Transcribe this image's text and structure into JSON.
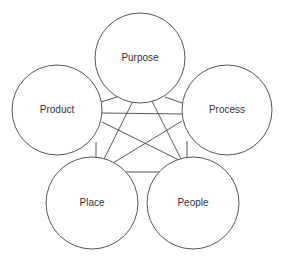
{
  "diagram": {
    "type": "five-node interconnection diagram",
    "stroke_color": "#555555",
    "text_color": "#333333",
    "background": "#ffffff",
    "nodes": [
      {
        "id": "purpose",
        "label": "Purpose",
        "cx": 140,
        "cy": 58,
        "r": 45
      },
      {
        "id": "product",
        "label": "Product",
        "cx": 57,
        "cy": 110,
        "r": 45
      },
      {
        "id": "process",
        "label": "Process",
        "cx": 227,
        "cy": 110,
        "r": 45
      },
      {
        "id": "place",
        "label": "Place",
        "cx": 92,
        "cy": 203,
        "r": 46
      },
      {
        "id": "people",
        "label": "People",
        "cx": 193,
        "cy": 203,
        "r": 46
      }
    ],
    "edges": [
      {
        "from": "purpose",
        "to": "product",
        "x1": 117,
        "y1": 97,
        "x2": 101,
        "y2": 102
      },
      {
        "from": "purpose",
        "to": "process",
        "x1": 165,
        "y1": 97,
        "x2": 182,
        "y2": 103
      },
      {
        "from": "product",
        "to": "process",
        "x1": 102,
        "y1": 113,
        "x2": 182,
        "y2": 114
      },
      {
        "from": "purpose",
        "to": "place",
        "x1": 133,
        "y1": 101,
        "x2": 103,
        "y2": 161
      },
      {
        "from": "purpose",
        "to": "people",
        "x1": 152,
        "y1": 101,
        "x2": 182,
        "y2": 161
      },
      {
        "from": "product",
        "to": "people",
        "x1": 102,
        "y1": 122,
        "x2": 181,
        "y2": 161
      },
      {
        "from": "process",
        "to": "place",
        "x1": 182,
        "y1": 121,
        "x2": 113,
        "y2": 163
      },
      {
        "from": "product",
        "to": "place",
        "x1": 96,
        "y1": 142,
        "x2": 96,
        "y2": 160
      },
      {
        "from": "process",
        "to": "people",
        "x1": 187,
        "y1": 141,
        "x2": 187,
        "y2": 160
      },
      {
        "from": "place",
        "to": "people",
        "x1": 122,
        "y1": 172,
        "x2": 163,
        "y2": 172
      }
    ]
  }
}
